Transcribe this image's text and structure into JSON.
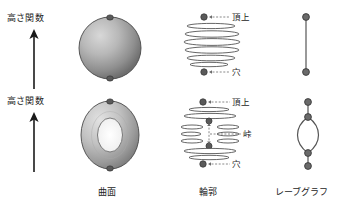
{
  "figure": {
    "title_present": false,
    "background": "#ffffff",
    "ink": "#333333",
    "dot_color": "#555555",
    "width": 354,
    "height": 211
  },
  "columns": [
    {
      "key": "surface",
      "label": "曲面"
    },
    {
      "key": "contour",
      "label": "輪郭"
    },
    {
      "key": "reeb",
      "label": "レーブグラフ"
    }
  ],
  "axis_labels": [
    {
      "key": "height_function_top",
      "label": "高さ関数",
      "arrow": "up-arrow-icon"
    },
    {
      "key": "height_function_bottom",
      "label": "高さ関数",
      "arrow": "up-arrow-icon"
    }
  ],
  "rows": [
    {
      "key": "sphere",
      "surface": {
        "shape": "sphere",
        "critical_points": [
          "top",
          "bottom"
        ]
      },
      "contour": {
        "labels": [
          {
            "key": "summit",
            "text": "頂上",
            "at": "top"
          },
          {
            "key": "pit",
            "text": "穴",
            "at": "bottom"
          }
        ],
        "level_count": 6
      },
      "reeb": {
        "shape": "segment",
        "nodes": 2,
        "edges": 1
      }
    },
    {
      "key": "torus",
      "surface": {
        "shape": "torus",
        "critical_points": [
          "top",
          "bottom"
        ]
      },
      "contour": {
        "labels": [
          {
            "key": "summit",
            "text": "頂上",
            "at": "top"
          },
          {
            "key": "saddle",
            "text": "峠",
            "at": "middle"
          },
          {
            "key": "pit",
            "text": "穴",
            "at": "bottom"
          }
        ],
        "level_count": 10
      },
      "reeb": {
        "shape": "theta",
        "nodes": 4,
        "edges": 4
      }
    }
  ]
}
